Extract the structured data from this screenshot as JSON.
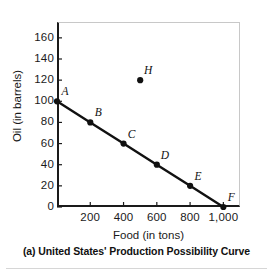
{
  "caption": "(a) United States' Production Possibility Curve",
  "chart_data": {
    "type": "line",
    "title": "",
    "xlabel": "Food (in tons)",
    "ylabel": "Oil (in barrels)",
    "xlim": [
      0,
      1100
    ],
    "ylim": [
      0,
      175
    ],
    "xticks": [
      200,
      400,
      600,
      800,
      1000
    ],
    "xtick_labels": [
      "200",
      "400",
      "600",
      "800",
      "1,000"
    ],
    "yticks": [
      0,
      20,
      40,
      60,
      80,
      100,
      120,
      140,
      160
    ],
    "ytick_labels": [
      "0",
      "20",
      "40",
      "60",
      "80",
      "100",
      "120",
      "140",
      "160"
    ],
    "grid": false,
    "legend": "none",
    "series": [
      {
        "name": "Production Possibility Curve",
        "line_color": "#111111",
        "marker_color": "#111111",
        "x": [
          0,
          200,
          400,
          600,
          800,
          1000
        ],
        "values": [
          100,
          80,
          60,
          40,
          20,
          0
        ],
        "point_labels": [
          "A",
          "B",
          "C",
          "D",
          "E",
          "F"
        ]
      },
      {
        "name": "Unattainable point",
        "line_color": "none",
        "marker_color": "#111111",
        "x": [
          500
        ],
        "values": [
          120
        ],
        "point_labels": [
          "H"
        ]
      }
    ],
    "annotations": [
      {
        "label": "A",
        "x": 0,
        "y": 100
      },
      {
        "label": "B",
        "x": 200,
        "y": 80
      },
      {
        "label": "C",
        "x": 400,
        "y": 60
      },
      {
        "label": "D",
        "x": 600,
        "y": 40
      },
      {
        "label": "E",
        "x": 800,
        "y": 20
      },
      {
        "label": "F",
        "x": 1000,
        "y": 0
      },
      {
        "label": "H",
        "x": 500,
        "y": 120
      }
    ]
  }
}
